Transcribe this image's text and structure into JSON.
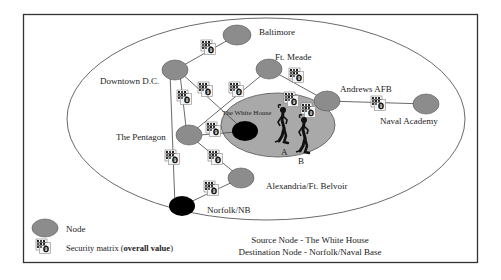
{
  "diagram": {
    "colors": {
      "node_fill": "#8c8c8c",
      "node_stroke": "#555555",
      "endpoint_fill": "#000000",
      "region_fill": "#a9a9a9",
      "line": "#444444",
      "frame": "#333333"
    },
    "nodes": [
      {
        "id": "baltimore",
        "label": "Baltimore",
        "type": "node"
      },
      {
        "id": "downtown-dc",
        "label": "Downtown D.C.",
        "type": "node"
      },
      {
        "id": "ft-meade",
        "label": "Ft. Meade",
        "type": "node"
      },
      {
        "id": "andrews-afb",
        "label": "Andrews AFB",
        "type": "node"
      },
      {
        "id": "naval-academy",
        "label": "Naval Academy",
        "type": "node"
      },
      {
        "id": "the-pentagon",
        "label": "The Pentagon",
        "type": "node"
      },
      {
        "id": "the-white-house",
        "label": "The White House",
        "type": "source"
      },
      {
        "id": "alexandria-ft-belvoir",
        "label": "Alexandria/Ft. Belvoir",
        "type": "node"
      },
      {
        "id": "norfolk-nb",
        "label": "Norfolk/NB",
        "type": "destination"
      }
    ],
    "edges": [
      [
        "downtown-dc",
        "baltimore"
      ],
      [
        "downtown-dc",
        "the-pentagon"
      ],
      [
        "downtown-dc",
        "norfolk-nb"
      ],
      [
        "downtown-dc",
        "the-white-house"
      ],
      [
        "the-pentagon",
        "ft-meade"
      ],
      [
        "ft-meade",
        "andrews-afb"
      ],
      [
        "andrews-afb",
        "naval-academy"
      ],
      [
        "the-pentagon",
        "the-white-house"
      ],
      [
        "the-pentagon",
        "alexandria-ft-belvoir"
      ],
      [
        "alexandria-ft-belvoir",
        "norfolk-nb"
      ]
    ],
    "figures": [
      {
        "id": "person-a",
        "label": "A"
      },
      {
        "id": "person-b",
        "label": "B"
      }
    ],
    "security_matrix_icon": "security-matrix-icon"
  },
  "legend": {
    "node_label": "Node",
    "matrix_label_prefix": "Security matrix (",
    "matrix_label_bold": "overall value",
    "matrix_label_suffix": ")"
  },
  "footer": {
    "source": "Source Node - The White House",
    "destination": "Destination Node - Norfolk/Naval Base"
  }
}
